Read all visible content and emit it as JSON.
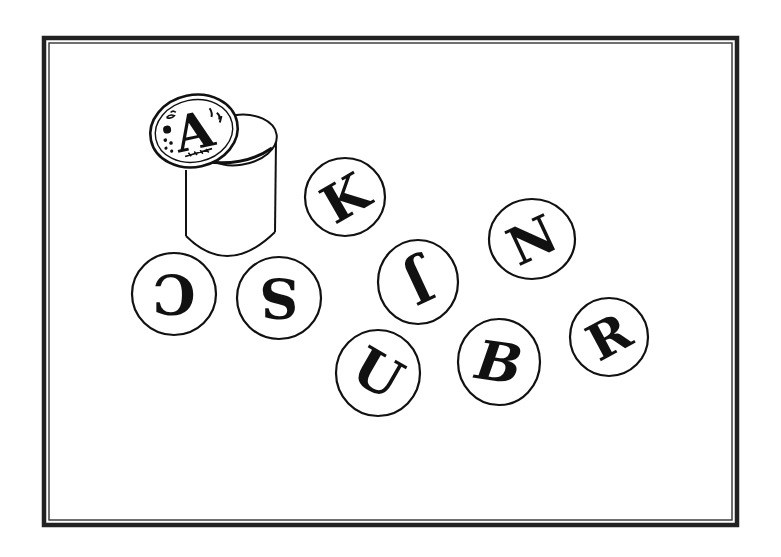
{
  "illustration": {
    "description": "Line drawing of a cylindrical stamp with an 'A' seal on top, surrounded by scattered circular letter tokens",
    "frame": {
      "style": "double-line border",
      "color": "#222222"
    },
    "stamp": {
      "letter": "A",
      "style": "ornate seal with decorative sprigs and dots"
    },
    "tokens": [
      {
        "letter": "C",
        "rotation": 180
      },
      {
        "letter": "S",
        "rotation": 180
      },
      {
        "letter": "K",
        "rotation": -30
      },
      {
        "letter": "J",
        "rotation": 155
      },
      {
        "letter": "N",
        "rotation": -25
      },
      {
        "letter": "U",
        "rotation": 30
      },
      {
        "letter": "B",
        "rotation": 12
      },
      {
        "letter": "R",
        "rotation": -28
      }
    ]
  }
}
